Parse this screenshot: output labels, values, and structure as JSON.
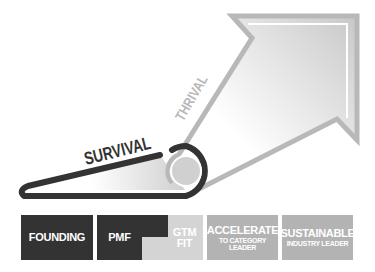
{
  "diagram": {
    "labels": {
      "survival": "SURVIVAL",
      "thrival": "THRIVAL"
    },
    "stages": [
      {
        "id": "founding",
        "main": "FOUNDING",
        "sub": "",
        "color": "#333333"
      },
      {
        "id": "pmf",
        "main": "PMF",
        "sub": "",
        "color": "#333333"
      },
      {
        "id": "gtm-fit",
        "main": "GTM",
        "sub": "FIT",
        "color": "#d4d4d4"
      },
      {
        "id": "accelerate",
        "main": "ACCELERATE",
        "sub": "TO CATEGORY LEADER",
        "color": "#b3b3b3"
      },
      {
        "id": "sustainable",
        "main": "SUSTAINABLE",
        "sub": "INDUSTRY LEADER",
        "color": "#b3b3b3"
      }
    ],
    "colors": {
      "survival_stroke": "#333333",
      "thrival_stroke": "#b8b8b8",
      "pulley_fill": "#d0d0d0",
      "background": "#ffffff"
    }
  }
}
